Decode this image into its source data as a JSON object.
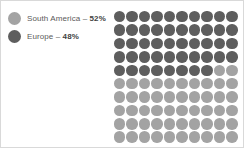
{
  "chart_data": {
    "type": "pie",
    "title": "",
    "subtitle": "",
    "xlabel": "",
    "ylabel": "",
    "legend_position": "left",
    "grid": false,
    "unit": "percent",
    "total_cells": 100,
    "grid_columns": 10,
    "grid_rows": 10,
    "fill_order": "row-major-top-left",
    "categories": [
      "Europe",
      "South America"
    ],
    "values": [
      48,
      52
    ],
    "series": [
      {
        "name": "Europe",
        "value": 48,
        "value_label": "48%",
        "color": "#5e5e5e",
        "cells": 48
      },
      {
        "name": "South America",
        "value": 52,
        "value_label": "52%",
        "color": "#a3a3a3",
        "cells": 52
      }
    ],
    "annotations": []
  },
  "legend": {
    "items": [
      {
        "swatch_name": "legend-swatch-south-america",
        "color": "#a3a3a3",
        "label": "South America",
        "separator": " – ",
        "value_label": "52%"
      },
      {
        "swatch_name": "legend-swatch-europe",
        "color": "#5e5e5e",
        "label": "Europe",
        "separator": " – ",
        "value_label": "48%"
      }
    ]
  },
  "colors": {
    "dark": "#5e5e5e",
    "light": "#a3a3a3",
    "background": "#ffffff",
    "border": "#d9d9d9",
    "text": "#5a5a5a",
    "text_bold": "#3f3f3f"
  }
}
